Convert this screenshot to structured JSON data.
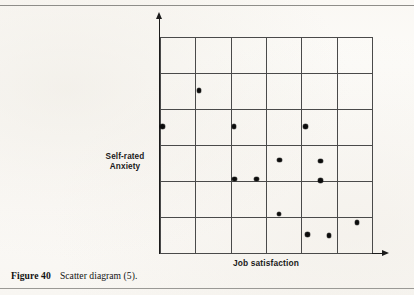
{
  "page": {
    "background_color": "#fbfaf7",
    "rule_color": "#8e8d89"
  },
  "caption": {
    "figure_number": "Figure 40",
    "text": "Scatter diagram (5)."
  },
  "axis_titles": {
    "y_line_1": "Self-rated",
    "y_line_2": "Anxiety",
    "x": "Job satisfaction"
  },
  "chart_data": {
    "type": "scatter",
    "title": "",
    "xlabel": "Job satisfaction",
    "ylabel": "Self-rated Anxiety",
    "xlim": [
      0,
      6
    ],
    "ylim": [
      0,
      6
    ],
    "grid": true,
    "grid_columns": 6,
    "grid_rows": 6,
    "axis_tick_labels": {
      "x": [],
      "y": []
    },
    "legend": [],
    "annotations": [],
    "marker": {
      "shape": "filled-circle",
      "color": "#0c0c0c",
      "size_px": 4.6
    },
    "n_points": 13,
    "points": [
      {
        "x": 1.1,
        "y": 4.52
      },
      {
        "x": 0.07,
        "y": 3.52
      },
      {
        "x": 2.09,
        "y": 3.52
      },
      {
        "x": 4.11,
        "y": 3.52
      },
      {
        "x": 3.38,
        "y": 2.58
      },
      {
        "x": 4.55,
        "y": 2.55
      },
      {
        "x": 2.11,
        "y": 2.05
      },
      {
        "x": 2.73,
        "y": 2.05
      },
      {
        "x": 4.55,
        "y": 2.02
      },
      {
        "x": 3.37,
        "y": 1.08
      },
      {
        "x": 5.58,
        "y": 0.85
      },
      {
        "x": 4.18,
        "y": 0.52
      },
      {
        "x": 4.78,
        "y": 0.48
      }
    ]
  }
}
